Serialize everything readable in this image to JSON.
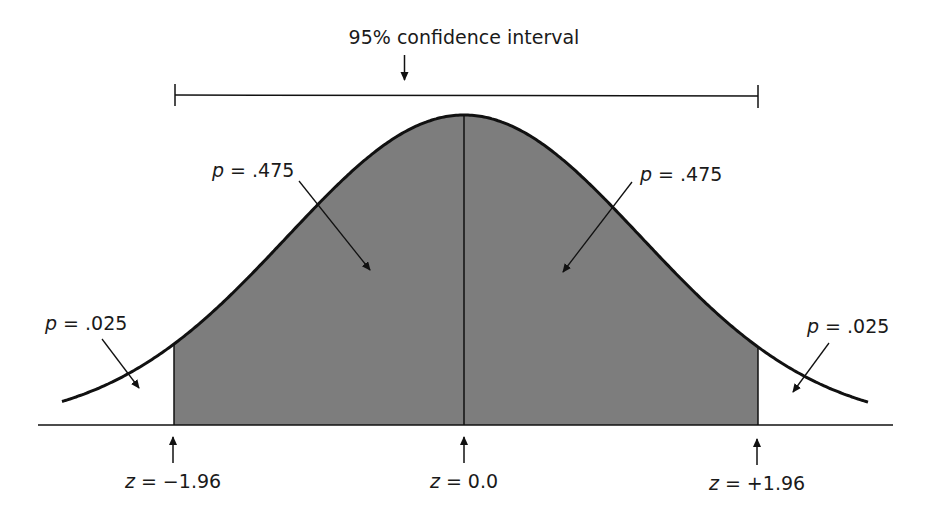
{
  "title": "95% confidence interval",
  "colors": {
    "shade": "#7d7d7d",
    "line": "#111111",
    "background": "#ffffff"
  },
  "region_labels": {
    "left_tail": {
      "var": "p",
      "eq": " = .025"
    },
    "left_center": {
      "var": "p",
      "eq": " = .475"
    },
    "right_center": {
      "var": "p",
      "eq": " = .475"
    },
    "right_tail": {
      "var": "p",
      "eq": " = .025"
    }
  },
  "z_labels": {
    "left": {
      "var": "z",
      "eq": " = −1.96"
    },
    "center": {
      "var": "z",
      "eq": " = 0.0"
    },
    "right": {
      "var": "z",
      "eq": " = +1.96"
    }
  },
  "chart_data": {
    "type": "area",
    "title": "95% confidence interval",
    "distribution": "standard normal",
    "shaded_interval": [
      -1.96,
      1.96
    ],
    "center": 0.0,
    "regions": [
      {
        "from": "-inf",
        "to": -1.96,
        "p": 0.025,
        "shaded": false
      },
      {
        "from": -1.96,
        "to": 0.0,
        "p": 0.475,
        "shaded": true
      },
      {
        "from": 0.0,
        "to": 1.96,
        "p": 0.475,
        "shaded": true
      },
      {
        "from": 1.96,
        "to": "inf",
        "p": 0.025,
        "shaded": false
      }
    ],
    "marked_z": [
      -1.96,
      0.0,
      1.96
    ],
    "annotations": [
      "p = .025",
      "p = .475",
      "p = .475",
      "p = .025",
      "z = −1.96",
      "z = 0.0",
      "z = +1.96",
      "95% confidence interval"
    ]
  }
}
